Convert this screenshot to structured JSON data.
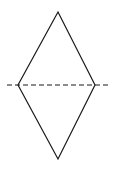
{
  "diagram": {
    "type": "rhombus-with-symmetry-axis",
    "stroke_color": "#1a1a1a",
    "background": "#ffffff",
    "rhombus": {
      "vertices": {
        "top": [
          58,
          12
        ],
        "right": [
          95,
          85
        ],
        "bottom": [
          58,
          159
        ],
        "left": [
          18,
          85
        ]
      }
    },
    "axis_line": {
      "style": "dashed",
      "x1": 7,
      "x2": 110,
      "y": 85
    }
  }
}
